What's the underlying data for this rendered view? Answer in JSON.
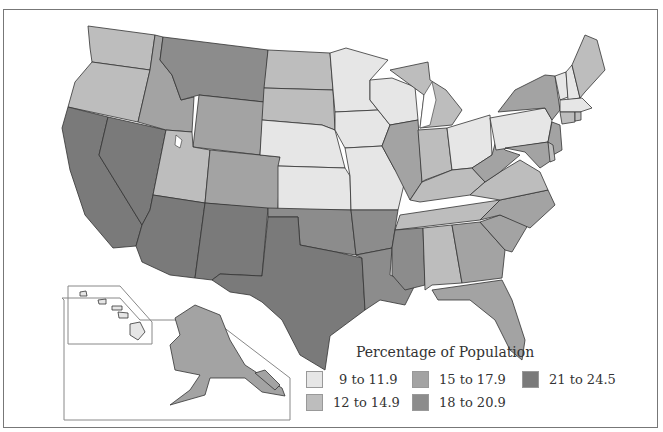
{
  "map": {
    "type": "choropleth",
    "region": "United States",
    "legend_title": "Percentage of Population",
    "bins": [
      {
        "id": "b1",
        "label": "9 to 11.9",
        "color": "#e6e6e6"
      },
      {
        "id": "b2",
        "label": "12 to 14.9",
        "color": "#bdbdbd"
      },
      {
        "id": "b3",
        "label": "15 to 17.9",
        "color": "#a3a3a3"
      },
      {
        "id": "b4",
        "label": "18 to 20.9",
        "color": "#8c8c8c"
      },
      {
        "id": "b5",
        "label": "21 to 24.5",
        "color": "#7a7a7a"
      }
    ],
    "states": {
      "WA": "b2",
      "OR": "b2",
      "CA": "b5",
      "NV": "b5",
      "ID": "b3",
      "MT": "b4",
      "WY": "b3",
      "UT": "b2",
      "CO": "b3",
      "AZ": "b5",
      "NM": "b5",
      "ND": "b2",
      "SD": "b2",
      "NE": "b1",
      "KS": "b1",
      "OK": "b4",
      "TX": "b5",
      "MN": "b1",
      "IA": "b1",
      "MO": "b1",
      "AR": "b4",
      "LA": "b4",
      "WI": "b1",
      "IL": "b3",
      "MI": "b2",
      "IN": "b2",
      "OH": "b1",
      "KY": "b2",
      "TN": "b2",
      "MS": "b4",
      "AL": "b2",
      "GA": "b3",
      "FL": "b3",
      "SC": "b3",
      "NC": "b3",
      "VA": "b2",
      "WV": "b3",
      "PA": "b1",
      "NY": "b3",
      "NJ": "b3",
      "MD": "b3",
      "DE": "b2",
      "VT": "b1",
      "NH": "b1",
      "ME": "b2",
      "MA": "b1",
      "CT": "b2",
      "RI": "b2",
      "AK": "b3",
      "HI": "b1"
    }
  }
}
